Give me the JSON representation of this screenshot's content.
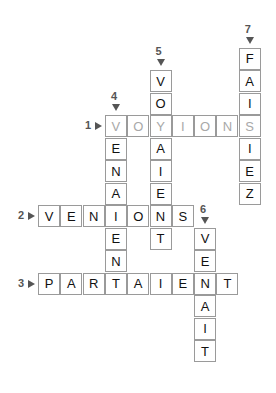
{
  "puzzle": {
    "type": "crossword",
    "grid": {
      "origin_x": 38,
      "origin_y": 47.5,
      "pitch_x": 22.3,
      "pitch_y": 22.5
    },
    "words": [
      {
        "number": "1",
        "direction": "across",
        "answer": "VOYIONS",
        "row": 3,
        "col": 3,
        "style": "hint"
      },
      {
        "number": "2",
        "direction": "across",
        "answer": "VENIONS",
        "row": 7,
        "col": 0,
        "style": "normal"
      },
      {
        "number": "3",
        "direction": "across",
        "answer": "PARTAIENT",
        "row": 10,
        "col": 0,
        "style": "normal"
      },
      {
        "number": "4",
        "direction": "down",
        "answer": "VENAIENT",
        "row": 3,
        "col": 3,
        "style": "normal"
      },
      {
        "number": "5",
        "direction": "down",
        "answer": "VOYAIENT",
        "row": 1,
        "col": 5,
        "style": "normal"
      },
      {
        "number": "6",
        "direction": "down",
        "answer": "VENAIT",
        "row": 8,
        "col": 7,
        "style": "normal"
      },
      {
        "number": "7",
        "direction": "down",
        "answer": "FAISIEZ",
        "row": 0,
        "col": 9,
        "style": "normal"
      }
    ]
  }
}
